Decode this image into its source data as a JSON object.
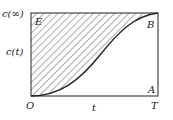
{
  "labels": {
    "c_inf": "c(∞)",
    "c_t": "c(t)",
    "E": "E",
    "B": "B",
    "A": "A",
    "O": "O",
    "t": "t",
    "T": "T"
  },
  "colors": {
    "line": "#222222",
    "hatch": "#333333",
    "background": "#ffffff"
  }
}
